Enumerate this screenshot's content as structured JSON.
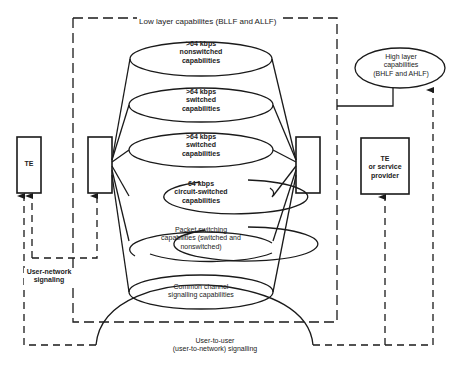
{
  "diagram": {
    "low_layer_label": "Low layer capabilites (BLLF and ALLF)",
    "high_layer": {
      "line1": "High layer",
      "line2": "capabilities",
      "line3": "(BHLF and AHLF)"
    },
    "te_left": "TE",
    "te_right": {
      "line1": "TE",
      "line2": "or service",
      "line3": "provider"
    },
    "capabilities": [
      {
        "line1": ">64 kbps",
        "line2": "nonswitched",
        "line3": "capabilities"
      },
      {
        "line1": ">64 kbps",
        "line2": "switched",
        "line3": "capabilities"
      },
      {
        "line1": ">64 kbps",
        "line2": "switched",
        "line3": "capabilities"
      },
      {
        "line1": "64 kbps",
        "line2": "circuit-switched",
        "line3": "capabilities"
      },
      {
        "line1": "Packet switching",
        "line2": "capabilities (switched and",
        "line3": "nonswitched)"
      },
      {
        "line1": "Common channel",
        "line2": "signalling capabilities",
        "line3": ""
      }
    ],
    "user_network": {
      "line1": "User-network",
      "line2": "signaling"
    },
    "user_to_user": {
      "line1": "User-to-user",
      "line2": "(user-to-network) signalling"
    },
    "colors": {
      "line": "#1a1a1a",
      "background": "#ffffff"
    }
  }
}
